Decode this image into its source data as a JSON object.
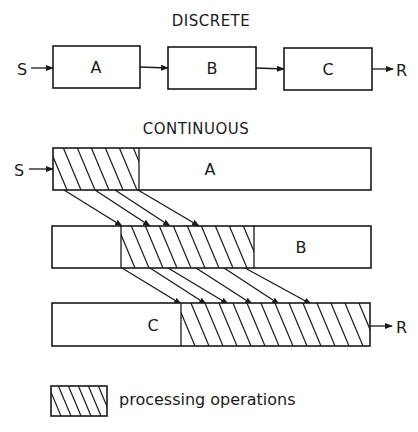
{
  "discrete": {
    "title": "DISCRETE",
    "source_label": "S",
    "result_label": "R",
    "boxes": [
      {
        "label": "A",
        "x": 53,
        "y": 46,
        "w": 87,
        "h": 42
      },
      {
        "label": "B",
        "x": 168,
        "y": 47,
        "w": 88,
        "h": 42
      },
      {
        "label": "C",
        "x": 284,
        "y": 48,
        "w": 88,
        "h": 42
      }
    ]
  },
  "continuous": {
    "title": "CONTINUOUS",
    "source_label": "S",
    "result_label": "R",
    "bars": [
      {
        "label": "A",
        "x": 53,
        "y": 148,
        "w": 318,
        "h": 42,
        "hatch_from": 53,
        "hatch_to": 139,
        "label_x": 210
      },
      {
        "label": "B",
        "x": 52,
        "y": 226,
        "w": 319,
        "h": 42,
        "hatch_from": 121,
        "hatch_to": 254,
        "label_x": 301
      },
      {
        "label": "C",
        "x": 52,
        "y": 303,
        "w": 318,
        "h": 43,
        "hatch_from": 181,
        "hatch_to": 370,
        "label_x": 153
      }
    ],
    "transfers_a_to_b": [
      [
        64,
        190,
        122,
        226
      ],
      [
        95,
        190,
        150,
        226
      ],
      [
        115,
        190,
        170,
        226
      ],
      [
        138,
        190,
        199,
        226
      ]
    ],
    "transfers_b_to_c": [
      [
        122,
        268,
        181,
        304
      ],
      [
        150,
        268,
        206,
        304
      ],
      [
        168,
        268,
        228,
        304
      ],
      [
        196,
        268,
        252,
        304
      ],
      [
        224,
        268,
        279,
        304
      ],
      [
        245,
        268,
        311,
        304
      ]
    ]
  },
  "legend": {
    "label": "processing operations",
    "swatch": {
      "x": 51,
      "y": 386,
      "w": 56,
      "h": 30
    }
  },
  "colors": {
    "ink": "#1a1a1a",
    "paper": "#ffffff"
  }
}
